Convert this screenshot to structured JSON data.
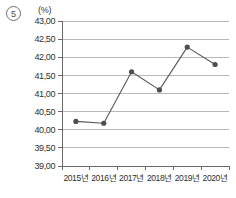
{
  "figure": {
    "item_number": "5",
    "unit_label": "(%)"
  },
  "chart_data": {
    "type": "line",
    "title": "",
    "subtitle": "",
    "xlabel": "",
    "ylabel": "",
    "unit": "(%)",
    "categories": [
      "2015년",
      "2016년",
      "2017년",
      "2018년",
      "2019년",
      "2020년"
    ],
    "values": [
      40.23,
      40.18,
      41.6,
      41.1,
      42.28,
      41.8
    ],
    "series": [
      {
        "name": "",
        "values": [
          40.23,
          40.18,
          41.6,
          41.1,
          42.28,
          41.8
        ]
      }
    ],
    "ylim": [
      39.0,
      43.0
    ],
    "ytick_values": [
      39.0,
      39.5,
      40.0,
      40.5,
      41.0,
      41.5,
      42.0,
      42.5,
      43.0
    ],
    "ytick_labels": [
      "39,00",
      "39,50",
      "40,00",
      "40,50",
      "41,00",
      "41,50",
      "42,00",
      "42,50",
      "43,00"
    ],
    "grid": true,
    "grid_axis": "y",
    "legend": false,
    "legend_position": "none",
    "marker": "circle",
    "line_color": "#58585a",
    "marker_color": "#4e4e50",
    "grid_color": "#9a9a9a",
    "decimal_separator": ","
  }
}
